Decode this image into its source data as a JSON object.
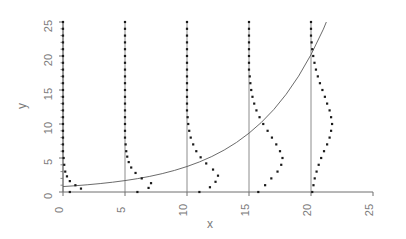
{
  "chart_data": {
    "type": "scatter",
    "title": "",
    "xlabel": "x",
    "ylabel": "y",
    "xlim": [
      0,
      25
    ],
    "ylim": [
      0,
      25
    ],
    "grid": false,
    "legend": null,
    "xticks": [
      0,
      5,
      10,
      15,
      20,
      25
    ],
    "xtick_labels": [
      "0",
      "5",
      "10",
      "15",
      "20",
      "25"
    ],
    "yticks": [
      0,
      5,
      10,
      15,
      20,
      25
    ],
    "ytick_labels": [
      "0",
      "5",
      "10",
      "15",
      "20",
      "25"
    ],
    "yminorticks": [
      1,
      2,
      3,
      4,
      6,
      7,
      8,
      9,
      11,
      12,
      13,
      14,
      16,
      17,
      18,
      19,
      21,
      22,
      23,
      24
    ],
    "series": [
      {
        "name": "mean-curve",
        "type": "line",
        "x": [
          0,
          1,
          2,
          3,
          4,
          5,
          6,
          7,
          8,
          9,
          10,
          11,
          12,
          13,
          14,
          15,
          16,
          17,
          18,
          19,
          20,
          21,
          22,
          23,
          24,
          25
        ],
        "y": [
          0.8,
          0.92,
          1.07,
          1.24,
          1.44,
          1.68,
          1.96,
          2.3,
          2.7,
          3.18,
          3.75,
          4.42,
          5.22,
          6.17,
          7.3,
          8.65,
          10.24,
          12.13,
          14.38,
          17.04,
          20.2,
          23.95,
          28.4,
          33.7,
          40.0,
          47.5
        ],
        "y_visible_max": 25
      },
      {
        "name": "reference-lines",
        "type": "vertical-lines",
        "x": [
          0,
          5,
          10,
          15,
          20
        ],
        "y_from": 0,
        "y_to": 25
      },
      {
        "name": "density-profile-x0",
        "type": "dot-column",
        "x_base": 0,
        "mean": 0.8,
        "dots": [
          {
            "y": 0.0,
            "dx": 0.55
          },
          {
            "y": 0.5,
            "dx": 1.45
          },
          {
            "y": 1.0,
            "dx": 1.0
          },
          {
            "y": 1.6,
            "dx": 0.55
          },
          {
            "y": 2.3,
            "dx": 0.32
          },
          {
            "y": 3.0,
            "dx": 0.18
          },
          {
            "y": 4.0,
            "dx": 0.1
          },
          {
            "y": 5.0,
            "dx": 0.05
          },
          {
            "y": 6.0,
            "dx": 0.0
          },
          {
            "y": 7.0,
            "dx": 0.0
          },
          {
            "y": 8.0,
            "dx": 0.0
          },
          {
            "y": 9.0,
            "dx": 0.0
          },
          {
            "y": 10.0,
            "dx": 0.0
          },
          {
            "y": 11.0,
            "dx": 0.0
          },
          {
            "y": 12.0,
            "dx": 0.0
          },
          {
            "y": 13.0,
            "dx": 0.0
          },
          {
            "y": 14.0,
            "dx": 0.0
          },
          {
            "y": 15.0,
            "dx": 0.0
          },
          {
            "y": 16.0,
            "dx": 0.0
          },
          {
            "y": 17.0,
            "dx": 0.0
          },
          {
            "y": 18.0,
            "dx": 0.0
          },
          {
            "y": 19.0,
            "dx": 0.0
          },
          {
            "y": 20.0,
            "dx": 0.0
          },
          {
            "y": 21.0,
            "dx": 0.0
          },
          {
            "y": 22.0,
            "dx": 0.0
          },
          {
            "y": 23.0,
            "dx": 0.0
          },
          {
            "y": 24.0,
            "dx": 0.0
          },
          {
            "y": 25.0,
            "dx": 0.0
          }
        ]
      },
      {
        "name": "density-profile-x5",
        "type": "dot-column",
        "x_base": 5,
        "mean": 1.68,
        "dots": [
          {
            "y": 0.0,
            "dx": 1.0
          },
          {
            "y": 0.6,
            "dx": 1.9
          },
          {
            "y": 1.3,
            "dx": 2.1
          },
          {
            "y": 2.0,
            "dx": 1.35
          },
          {
            "y": 2.8,
            "dx": 0.85
          },
          {
            "y": 3.6,
            "dx": 0.5
          },
          {
            "y": 4.4,
            "dx": 0.3
          },
          {
            "y": 5.2,
            "dx": 0.18
          },
          {
            "y": 6.0,
            "dx": 0.1
          },
          {
            "y": 7.0,
            "dx": 0.05
          },
          {
            "y": 8.0,
            "dx": 0.0
          },
          {
            "y": 9.0,
            "dx": 0.0
          },
          {
            "y": 10.0,
            "dx": 0.0
          },
          {
            "y": 11.0,
            "dx": 0.0
          },
          {
            "y": 12.0,
            "dx": 0.0
          },
          {
            "y": 13.0,
            "dx": 0.0
          },
          {
            "y": 14.0,
            "dx": 0.0
          },
          {
            "y": 15.0,
            "dx": 0.0
          },
          {
            "y": 16.0,
            "dx": 0.0
          },
          {
            "y": 17.0,
            "dx": 0.0
          },
          {
            "y": 18.0,
            "dx": 0.0
          },
          {
            "y": 19.0,
            "dx": 0.0
          },
          {
            "y": 20.0,
            "dx": 0.0
          },
          {
            "y": 21.0,
            "dx": 0.0
          },
          {
            "y": 22.0,
            "dx": 0.0
          },
          {
            "y": 23.0,
            "dx": 0.0
          },
          {
            "y": 24.0,
            "dx": 0.0
          },
          {
            "y": 25.0,
            "dx": 0.0
          }
        ]
      },
      {
        "name": "density-profile-x10",
        "type": "dot-column",
        "x_base": 10,
        "mean": 3.75,
        "dots": [
          {
            "y": 0.0,
            "dx": 1.0
          },
          {
            "y": 0.7,
            "dx": 1.85
          },
          {
            "y": 1.5,
            "dx": 2.3
          },
          {
            "y": 2.4,
            "dx": 2.5
          },
          {
            "y": 3.3,
            "dx": 2.1
          },
          {
            "y": 4.2,
            "dx": 1.55
          },
          {
            "y": 5.1,
            "dx": 1.1
          },
          {
            "y": 6.0,
            "dx": 0.75
          },
          {
            "y": 7.0,
            "dx": 0.5
          },
          {
            "y": 8.0,
            "dx": 0.3
          },
          {
            "y": 9.0,
            "dx": 0.18
          },
          {
            "y": 10.0,
            "dx": 0.1
          },
          {
            "y": 11.0,
            "dx": 0.05
          },
          {
            "y": 12.0,
            "dx": 0.0
          },
          {
            "y": 13.0,
            "dx": 0.0
          },
          {
            "y": 14.0,
            "dx": 0.0
          },
          {
            "y": 15.0,
            "dx": 0.0
          },
          {
            "y": 16.0,
            "dx": 0.0
          },
          {
            "y": 17.0,
            "dx": 0.0
          },
          {
            "y": 18.0,
            "dx": 0.0
          },
          {
            "y": 19.0,
            "dx": 0.0
          },
          {
            "y": 20.0,
            "dx": 0.0
          },
          {
            "y": 21.0,
            "dx": 0.0
          },
          {
            "y": 22.0,
            "dx": 0.0
          },
          {
            "y": 23.0,
            "dx": 0.0
          },
          {
            "y": 24.0,
            "dx": 0.0
          },
          {
            "y": 25.0,
            "dx": 0.0
          }
        ]
      },
      {
        "name": "density-profile-x15",
        "type": "dot-column",
        "x_base": 15,
        "mean": 8.65,
        "dots": [
          {
            "y": 0.0,
            "dx": 0.75
          },
          {
            "y": 1.0,
            "dx": 1.3
          },
          {
            "y": 2.0,
            "dx": 1.8
          },
          {
            "y": 3.0,
            "dx": 2.3
          },
          {
            "y": 4.0,
            "dx": 2.6
          },
          {
            "y": 5.0,
            "dx": 2.7
          },
          {
            "y": 6.0,
            "dx": 2.5
          },
          {
            "y": 7.0,
            "dx": 2.2
          },
          {
            "y": 8.0,
            "dx": 1.85
          },
          {
            "y": 9.0,
            "dx": 1.5
          },
          {
            "y": 10.0,
            "dx": 1.15
          },
          {
            "y": 11.0,
            "dx": 0.85
          },
          {
            "y": 12.0,
            "dx": 0.6
          },
          {
            "y": 13.0,
            "dx": 0.42
          },
          {
            "y": 14.0,
            "dx": 0.28
          },
          {
            "y": 15.0,
            "dx": 0.18
          },
          {
            "y": 16.0,
            "dx": 0.11
          },
          {
            "y": 17.0,
            "dx": 0.06
          },
          {
            "y": 18.0,
            "dx": 0.0
          },
          {
            "y": 19.0,
            "dx": 0.0
          },
          {
            "y": 20.0,
            "dx": 0.0
          },
          {
            "y": 21.0,
            "dx": 0.0
          },
          {
            "y": 22.0,
            "dx": 0.0
          },
          {
            "y": 23.0,
            "dx": 0.0
          },
          {
            "y": 24.0,
            "dx": 0.0
          },
          {
            "y": 25.0,
            "dx": 0.0
          }
        ]
      },
      {
        "name": "density-profile-x20",
        "type": "dot-column",
        "x_base": 20,
        "mean": 20.2,
        "dots": [
          {
            "y": 0.0,
            "dx": 0.1
          },
          {
            "y": 1.0,
            "dx": 0.2
          },
          {
            "y": 2.0,
            "dx": 0.3
          },
          {
            "y": 3.0,
            "dx": 0.45
          },
          {
            "y": 4.0,
            "dx": 0.62
          },
          {
            "y": 5.0,
            "dx": 0.82
          },
          {
            "y": 6.0,
            "dx": 1.05
          },
          {
            "y": 7.0,
            "dx": 1.3
          },
          {
            "y": 8.0,
            "dx": 1.5
          },
          {
            "y": 9.0,
            "dx": 1.62
          },
          {
            "y": 10.0,
            "dx": 1.7
          },
          {
            "y": 11.0,
            "dx": 1.62
          },
          {
            "y": 12.0,
            "dx": 1.5
          },
          {
            "y": 13.0,
            "dx": 1.3
          },
          {
            "y": 14.0,
            "dx": 1.12
          },
          {
            "y": 15.0,
            "dx": 0.92
          },
          {
            "y": 16.0,
            "dx": 0.72
          },
          {
            "y": 17.0,
            "dx": 0.55
          },
          {
            "y": 18.0,
            "dx": 0.4
          },
          {
            "y": 19.0,
            "dx": 0.28
          },
          {
            "y": 20.0,
            "dx": 0.18
          },
          {
            "y": 21.0,
            "dx": 0.1
          },
          {
            "y": 22.0,
            "dx": 0.05
          },
          {
            "y": 23.0,
            "dx": 0.0
          },
          {
            "y": 24.0,
            "dx": 0.0
          },
          {
            "y": 25.0,
            "dx": 0.0
          }
        ]
      }
    ]
  },
  "style": {
    "dot_color": "#1a1a1a",
    "line_color": "#5a5a5a",
    "axis_color": "#6e6e6e",
    "text_color": "#7a7a7a",
    "background": "#ffffff"
  }
}
